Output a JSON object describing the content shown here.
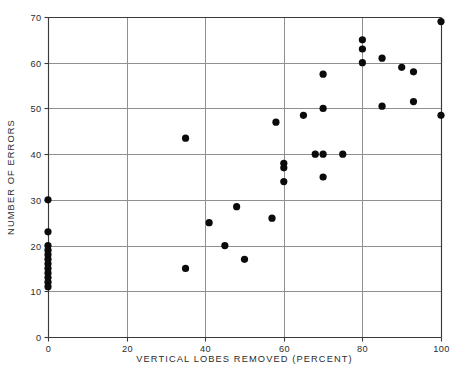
{
  "chart_data": {
    "type": "scatter",
    "title": "",
    "xlabel": "VERTICAL LOBES REMOVED (PERCENT)",
    "ylabel": "NUMBER OF ERRORS",
    "xlim": [
      0,
      100
    ],
    "ylim": [
      0,
      70
    ],
    "xticks": [
      0,
      20,
      40,
      60,
      80,
      100
    ],
    "yticks": [
      0,
      10,
      20,
      30,
      40,
      50,
      60,
      70
    ],
    "xtick_labels": [
      "0",
      "20",
      "40",
      "60",
      "80",
      "100"
    ],
    "ytick_labels": [
      "0",
      "10",
      "20",
      "30",
      "40",
      "50",
      "60",
      "70"
    ],
    "grid": "both",
    "legend": "none",
    "marker": "filled-circle",
    "marker_color": "#0b0b0b",
    "points": [
      {
        "x": 0,
        "y": 30
      },
      {
        "x": 0,
        "y": 23
      },
      {
        "x": 0,
        "y": 20
      },
      {
        "x": 0,
        "y": 19
      },
      {
        "x": 0,
        "y": 18
      },
      {
        "x": 0,
        "y": 17
      },
      {
        "x": 0,
        "y": 16
      },
      {
        "x": 0,
        "y": 15
      },
      {
        "x": 0,
        "y": 14
      },
      {
        "x": 0,
        "y": 13
      },
      {
        "x": 0,
        "y": 12
      },
      {
        "x": 0,
        "y": 11
      },
      {
        "x": 35,
        "y": 43.5
      },
      {
        "x": 35,
        "y": 15
      },
      {
        "x": 41,
        "y": 25
      },
      {
        "x": 45,
        "y": 20
      },
      {
        "x": 48,
        "y": 28.5
      },
      {
        "x": 50,
        "y": 17
      },
      {
        "x": 57,
        "y": 26
      },
      {
        "x": 58,
        "y": 47
      },
      {
        "x": 60,
        "y": 38
      },
      {
        "x": 60,
        "y": 37
      },
      {
        "x": 60,
        "y": 34
      },
      {
        "x": 65,
        "y": 48.5
      },
      {
        "x": 68,
        "y": 40
      },
      {
        "x": 70,
        "y": 57.5
      },
      {
        "x": 70,
        "y": 50
      },
      {
        "x": 70,
        "y": 40
      },
      {
        "x": 70,
        "y": 35
      },
      {
        "x": 75,
        "y": 40
      },
      {
        "x": 80,
        "y": 65
      },
      {
        "x": 80,
        "y": 63
      },
      {
        "x": 80,
        "y": 60
      },
      {
        "x": 85,
        "y": 61
      },
      {
        "x": 85,
        "y": 50.5
      },
      {
        "x": 90,
        "y": 59
      },
      {
        "x": 93,
        "y": 58
      },
      {
        "x": 93,
        "y": 51.5
      },
      {
        "x": 100,
        "y": 69
      },
      {
        "x": 100,
        "y": 48.5
      }
    ]
  }
}
